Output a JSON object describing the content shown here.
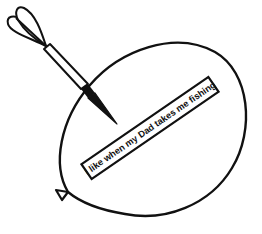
{
  "illustration": {
    "subject": "balloon pierced by a dart",
    "banner_text": "I like when my Dad takes me fishing",
    "colors": {
      "line": "#111111",
      "background": "#ffffff"
    },
    "icons": {
      "balloon": "balloon-icon",
      "dart": "dart-icon"
    }
  }
}
